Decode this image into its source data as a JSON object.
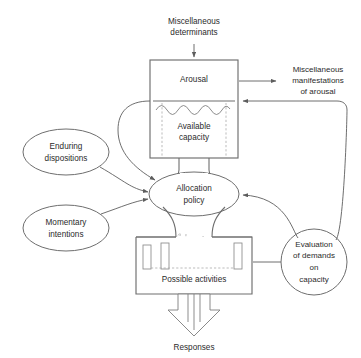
{
  "figure": {
    "background_color": "#ffffff",
    "line_color": "#6e6e6e",
    "text_color": "#2b2b2b",
    "dashed_color": "#a9a9a9"
  },
  "nodes": {
    "miscellaneous_determinants": {
      "line1": "Miscellaneous",
      "line2": "determinants",
      "shape": "text"
    },
    "arousal": {
      "label": "Arousal",
      "shape": "rectangle"
    },
    "available_capacity": {
      "line1": "Available",
      "line2": "capacity",
      "shape": "rectangle-lower-section"
    },
    "miscellaneous_manifestations": {
      "line1": "Miscellaneous",
      "line2": "manifestations",
      "line3": "of arousal",
      "shape": "text"
    },
    "enduring_dispositions": {
      "line1": "Enduring",
      "line2": "dispositions",
      "shape": "ellipse"
    },
    "momentary_intentions": {
      "line1": "Momentary",
      "line2": "intentions",
      "shape": "ellipse"
    },
    "allocation_policy": {
      "line1": "Allocation",
      "line2": "policy",
      "shape": "ellipse"
    },
    "possible_activities": {
      "label": "Possible activities",
      "shape": "rectangle"
    },
    "evaluation_of_demands": {
      "line1": "Evaluation",
      "line2": "of demands",
      "line3": "on",
      "line4": "capacity",
      "shape": "circle"
    },
    "responses": {
      "label": "Responses",
      "shape": "text"
    }
  },
  "connections": [
    {
      "name": "determinants-to-arousal",
      "from": "miscellaneous_determinants",
      "to": "arousal",
      "style": "arrow"
    },
    {
      "name": "arousal-to-manifestations",
      "from": "arousal",
      "to": "miscellaneous_manifestations",
      "style": "arrow"
    },
    {
      "name": "capacity-to-allocation",
      "from": "available_capacity",
      "to": "allocation_policy",
      "style": "curve-arrow"
    },
    {
      "name": "capacity-channel",
      "from": "available_capacity",
      "to": "allocation_policy",
      "style": "channel"
    },
    {
      "name": "dispositions-to-allocation",
      "from": "enduring_dispositions",
      "to": "allocation_policy",
      "style": "arrow"
    },
    {
      "name": "intentions-to-allocation",
      "from": "momentary_intentions",
      "to": "allocation_policy",
      "style": "arrow"
    },
    {
      "name": "allocation-to-activities",
      "from": "allocation_policy",
      "to": "possible_activities",
      "style": "channel"
    },
    {
      "name": "activities-to-evaluation",
      "from": "possible_activities",
      "to": "evaluation_of_demands",
      "style": "arrow"
    },
    {
      "name": "evaluation-to-allocation",
      "from": "evaluation_of_demands",
      "to": "allocation_policy",
      "style": "arrow"
    },
    {
      "name": "evaluation-to-arousal",
      "from": "evaluation_of_demands",
      "to": "arousal",
      "style": "arrow"
    },
    {
      "name": "activities-to-responses",
      "from": "possible_activities",
      "to": "responses",
      "style": "hollow-arrow"
    }
  ]
}
